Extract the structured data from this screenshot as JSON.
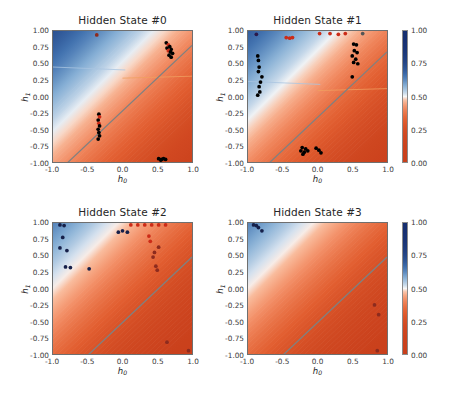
{
  "figure": {
    "background": "#ffffff",
    "width": 453,
    "height": 400
  },
  "chart_data": {
    "type": "heatmap",
    "title": "",
    "xlabel": "h_0",
    "ylabel": "h_1",
    "xlim": [
      -1.0,
      1.0
    ],
    "ylim": [
      -1.0,
      1.0
    ],
    "xticks": [
      -1.0,
      -0.5,
      0.0,
      0.5,
      1.0
    ],
    "xticklabels": [
      "-1.0",
      "-0.5",
      "0.0",
      "0.5",
      "1.0"
    ],
    "yticks": [
      -1.0,
      -0.75,
      -0.5,
      -0.25,
      0.0,
      0.25,
      0.5,
      0.75,
      1.0
    ],
    "yticklabels": [
      "-1.00",
      "-0.75",
      "-0.50",
      "-0.25",
      "0.00",
      "0.25",
      "0.50",
      "0.75",
      "1.00"
    ],
    "grid": false,
    "colormap": "RdBu",
    "colorbar": {
      "vmin": 0.0,
      "vmax": 1.0,
      "ticks": [
        0.0,
        0.25,
        0.5,
        0.75,
        1.0
      ],
      "ticklabels": [
        "0.00",
        "0.25",
        "0.50",
        "0.75",
        "1.00"
      ],
      "position": "right",
      "low_color": "#f0653a",
      "mid_color": "#f7f7f7",
      "high_color": "#1f3b73"
    },
    "panels": [
      {
        "title": "Hidden State #0",
        "boundary": {
          "slope": 1.0,
          "intercept": -0.22,
          "color": "#808080"
        },
        "hline_left": {
          "y": 0.45,
          "color": "#a9c4e0"
        },
        "hline_right": {
          "y": 0.31,
          "color": "#f0a060"
        },
        "points": [
          {
            "x": -0.37,
            "y": 0.94,
            "color": "#8d2b1e"
          },
          {
            "x": 0.63,
            "y": 0.82,
            "color": "#000000"
          },
          {
            "x": 0.66,
            "y": 0.79,
            "color": "#cc2b17"
          },
          {
            "x": 0.68,
            "y": 0.76,
            "color": "#000000"
          },
          {
            "x": 0.64,
            "y": 0.74,
            "color": "#000000"
          },
          {
            "x": 0.7,
            "y": 0.72,
            "color": "#000000"
          },
          {
            "x": 0.66,
            "y": 0.7,
            "color": "#cc2b17"
          },
          {
            "x": 0.69,
            "y": 0.68,
            "color": "#000000"
          },
          {
            "x": 0.72,
            "y": 0.66,
            "color": "#000000"
          },
          {
            "x": 0.67,
            "y": 0.63,
            "color": "#000000"
          },
          {
            "x": 0.7,
            "y": 0.6,
            "color": "#000000"
          },
          {
            "x": -0.34,
            "y": -0.27,
            "color": "#000000"
          },
          {
            "x": -0.33,
            "y": -0.31,
            "color": "#cc2b17"
          },
          {
            "x": -0.35,
            "y": -0.36,
            "color": "#000000"
          },
          {
            "x": -0.34,
            "y": -0.41,
            "color": "#cc2b17"
          },
          {
            "x": -0.33,
            "y": -0.45,
            "color": "#000000"
          },
          {
            "x": -0.35,
            "y": -0.5,
            "color": "#000000"
          },
          {
            "x": -0.34,
            "y": -0.55,
            "color": "#000000"
          },
          {
            "x": -0.33,
            "y": -0.6,
            "color": "#000000"
          },
          {
            "x": -0.35,
            "y": -0.65,
            "color": "#000000"
          },
          {
            "x": 0.52,
            "y": -0.95,
            "color": "#000000"
          },
          {
            "x": 0.56,
            "y": -0.96,
            "color": "#000000"
          },
          {
            "x": 0.59,
            "y": -0.95,
            "color": "#000000"
          },
          {
            "x": 0.62,
            "y": -0.96,
            "color": "#000000"
          },
          {
            "x": 0.55,
            "y": -0.97,
            "color": "#000000"
          }
        ]
      },
      {
        "title": "Hidden State #1",
        "boundary": {
          "slope": 1.0,
          "intercept": -0.32,
          "color": "#808080"
        },
        "hline_left": {
          "y": 0.23,
          "color": "#a9c4e0"
        },
        "hline_right": {
          "y": 0.12,
          "color": "#f0a060"
        },
        "points": [
          {
            "x": -0.88,
            "y": 0.95,
            "color": "#2b1a4a"
          },
          {
            "x": -0.45,
            "y": 0.9,
            "color": "#cc2b17"
          },
          {
            "x": -0.4,
            "y": 0.89,
            "color": "#cc2b17"
          },
          {
            "x": -0.36,
            "y": 0.9,
            "color": "#cc2b17"
          },
          {
            "x": 0.03,
            "y": 0.96,
            "color": "#cc2b17"
          },
          {
            "x": 0.18,
            "y": 0.96,
            "color": "#cc2b17"
          },
          {
            "x": 0.3,
            "y": 0.95,
            "color": "#cc2b17"
          },
          {
            "x": 0.4,
            "y": 0.96,
            "color": "#cc2b17"
          },
          {
            "x": 0.65,
            "y": 0.96,
            "color": "#555555"
          },
          {
            "x": -0.86,
            "y": 0.62,
            "color": "#000000"
          },
          {
            "x": -0.85,
            "y": 0.55,
            "color": "#000000"
          },
          {
            "x": -0.84,
            "y": 0.45,
            "color": "#000000"
          },
          {
            "x": -0.85,
            "y": 0.38,
            "color": "#000000"
          },
          {
            "x": -0.8,
            "y": 0.3,
            "color": "#000000"
          },
          {
            "x": -0.82,
            "y": 0.22,
            "color": "#000000"
          },
          {
            "x": -0.84,
            "y": 0.15,
            "color": "#000000"
          },
          {
            "x": -0.83,
            "y": 0.07,
            "color": "#000000"
          },
          {
            "x": -0.86,
            "y": 0.02,
            "color": "#000000"
          },
          {
            "x": 0.52,
            "y": 0.8,
            "color": "#000000"
          },
          {
            "x": 0.56,
            "y": 0.79,
            "color": "#000000"
          },
          {
            "x": 0.53,
            "y": 0.7,
            "color": "#000000"
          },
          {
            "x": 0.57,
            "y": 0.67,
            "color": "#000000"
          },
          {
            "x": 0.5,
            "y": 0.62,
            "color": "#000000"
          },
          {
            "x": 0.55,
            "y": 0.57,
            "color": "#000000"
          },
          {
            "x": 0.52,
            "y": 0.52,
            "color": "#000000"
          },
          {
            "x": 0.58,
            "y": 0.5,
            "color": "#000000"
          },
          {
            "x": 0.5,
            "y": 0.3,
            "color": "#000000"
          },
          {
            "x": -0.22,
            "y": -0.78,
            "color": "#000000"
          },
          {
            "x": -0.17,
            "y": -0.8,
            "color": "#000000"
          },
          {
            "x": -0.24,
            "y": -0.83,
            "color": "#000000"
          },
          {
            "x": -0.19,
            "y": -0.85,
            "color": "#000000"
          },
          {
            "x": -0.14,
            "y": -0.83,
            "color": "#000000"
          },
          {
            "x": -0.21,
            "y": -0.88,
            "color": "#000000"
          },
          {
            "x": -0.02,
            "y": -0.79,
            "color": "#000000"
          },
          {
            "x": 0.02,
            "y": -0.82,
            "color": "#000000"
          },
          {
            "x": 0.05,
            "y": -0.86,
            "color": "#000000"
          }
        ]
      },
      {
        "title": "Hidden State #2",
        "boundary": {
          "slope": 1.0,
          "intercept": -0.52,
          "color": "#808080"
        },
        "hline_left": null,
        "hline_right": null,
        "points": [
          {
            "x": -0.9,
            "y": 0.97,
            "color": "#16204a"
          },
          {
            "x": -0.84,
            "y": 0.96,
            "color": "#16204a"
          },
          {
            "x": -0.86,
            "y": 0.78,
            "color": "#16204a"
          },
          {
            "x": -0.9,
            "y": 0.62,
            "color": "#16204a"
          },
          {
            "x": -0.8,
            "y": 0.58,
            "color": "#16204a"
          },
          {
            "x": -0.82,
            "y": 0.33,
            "color": "#16204a"
          },
          {
            "x": -0.75,
            "y": 0.32,
            "color": "#16204a"
          },
          {
            "x": -0.48,
            "y": 0.3,
            "color": "#16204a"
          },
          {
            "x": -0.06,
            "y": 0.86,
            "color": "#16204a"
          },
          {
            "x": 0.0,
            "y": 0.88,
            "color": "#16204a"
          },
          {
            "x": 0.07,
            "y": 0.86,
            "color": "#16204a"
          },
          {
            "x": 0.12,
            "y": 0.97,
            "color": "#cc2b17"
          },
          {
            "x": 0.22,
            "y": 0.97,
            "color": "#cc2b17"
          },
          {
            "x": 0.32,
            "y": 0.97,
            "color": "#cc2b17"
          },
          {
            "x": 0.42,
            "y": 0.97,
            "color": "#cc2b17"
          },
          {
            "x": 0.52,
            "y": 0.97,
            "color": "#cc2b17"
          },
          {
            "x": 0.62,
            "y": 0.97,
            "color": "#cc2b17"
          },
          {
            "x": 0.38,
            "y": 0.8,
            "color": "#cc2b17"
          },
          {
            "x": 0.4,
            "y": 0.72,
            "color": "#cc2b17"
          },
          {
            "x": 0.52,
            "y": 0.63,
            "color": "#8d2b1e"
          },
          {
            "x": 0.46,
            "y": 0.55,
            "color": "#8d2b1e"
          },
          {
            "x": 0.44,
            "y": 0.48,
            "color": "#8d2b1e"
          },
          {
            "x": 0.48,
            "y": 0.34,
            "color": "#8d2b1e"
          },
          {
            "x": 0.5,
            "y": 0.28,
            "color": "#8d2b1e"
          },
          {
            "x": 0.64,
            "y": -0.82,
            "color": "#8d2b1e"
          },
          {
            "x": 0.95,
            "y": -0.95,
            "color": "#8d2b1e"
          }
        ]
      },
      {
        "title": "Hidden State #3",
        "boundary": {
          "slope": 1.0,
          "intercept": -0.52,
          "color": "#808080"
        },
        "hline_left": null,
        "hline_right": null,
        "points": [
          {
            "x": -0.92,
            "y": 0.97,
            "color": "#16204a"
          },
          {
            "x": -0.88,
            "y": 0.96,
            "color": "#16204a"
          },
          {
            "x": -0.85,
            "y": 0.93,
            "color": "#16204a"
          },
          {
            "x": -0.8,
            "y": 0.88,
            "color": "#16204a"
          },
          {
            "x": 0.82,
            "y": -0.25,
            "color": "#8d2b1e"
          },
          {
            "x": 0.88,
            "y": -0.4,
            "color": "#8d2b1e"
          },
          {
            "x": 0.86,
            "y": -0.95,
            "color": "#8d2b1e"
          }
        ]
      }
    ]
  }
}
